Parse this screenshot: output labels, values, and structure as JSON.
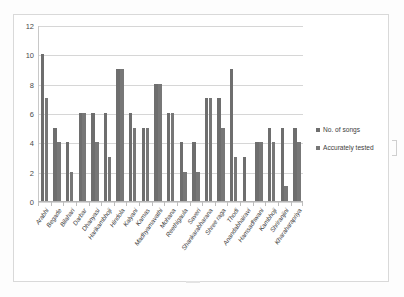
{
  "chart_data": {
    "type": "bar",
    "title": "",
    "xlabel": "",
    "ylabel": "",
    "ylim": [
      0,
      12
    ],
    "yticks": [
      0,
      2,
      4,
      6,
      8,
      10,
      12
    ],
    "grid": true,
    "legend_position": "right",
    "categories": [
      "Arabhi",
      "Begade",
      "Bilahari",
      "Darbar",
      "Dhanyasi",
      "Harikambhoji",
      "Hindola",
      "Kalyani",
      "Kamas",
      "Madhyamavathi",
      "Mohana",
      "Reethigaula",
      "Saveri",
      "Shankarabharana",
      "Shree raga",
      "Thodi",
      "Anandabhairavi",
      "Hamsadhwani",
      "Kambhoji",
      "Shriranjini",
      "Kharaharapriya"
    ],
    "series": [
      {
        "name": "No. of songs",
        "color": "#6e6e6e",
        "values": [
          10,
          5,
          4,
          6,
          6,
          6,
          9,
          6,
          5,
          8,
          6,
          4,
          4,
          7,
          7,
          9,
          3,
          4,
          5,
          5,
          5
        ]
      },
      {
        "name": "Accurately tested",
        "color": "#777777",
        "values": [
          7,
          4,
          2,
          6,
          4,
          3,
          9,
          5,
          5,
          8,
          6,
          2,
          2,
          7,
          5,
          3,
          0,
          4,
          4,
          1,
          4
        ]
      }
    ]
  },
  "legend": {
    "items": [
      {
        "label": "No. of songs"
      },
      {
        "label": "Accurately tested"
      }
    ]
  }
}
